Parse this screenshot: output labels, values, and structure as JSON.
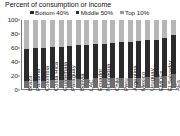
{
  "chart_data": {
    "type": "bar",
    "subtype": "stacked-100-percent",
    "title": "Percent of consumption or income",
    "xlabel": "",
    "ylabel": "",
    "ylim": [
      0,
      100
    ],
    "yticks": [
      0,
      20,
      40,
      60,
      80,
      100
    ],
    "grid": false,
    "legend_position": "top",
    "categories": [
      "Brazil",
      "Panama",
      "Colombia",
      "Costa Rica",
      "Guatemala",
      "Paraguay",
      "Bolivia",
      "LAC",
      "Ecuador",
      "Nicaragua",
      "Chile",
      "Peru",
      "Argentina",
      "Mexico",
      "Uruguay",
      "EMDEs",
      "El Salvador",
      "AEs"
    ],
    "series": [
      {
        "name": "Bottom 40%",
        "color": "#6e6e6e",
        "values": [
          10,
          11,
          11,
          12,
          12,
          12,
          13,
          13,
          14,
          14,
          14,
          14,
          15,
          15,
          16,
          16,
          17,
          21
        ]
      },
      {
        "name": "Middle 50%",
        "color": "#2b2b2b",
        "values": [
          47,
          48,
          48,
          49,
          49,
          50,
          50,
          51,
          51,
          51,
          52,
          53,
          53,
          54,
          55,
          55,
          56,
          57
        ]
      },
      {
        "name": "Top 10%",
        "color": "#b7b7b7",
        "values": [
          43,
          41,
          41,
          39,
          39,
          38,
          37,
          36,
          35,
          35,
          34,
          33,
          32,
          31,
          29,
          29,
          27,
          22
        ]
      }
    ]
  }
}
